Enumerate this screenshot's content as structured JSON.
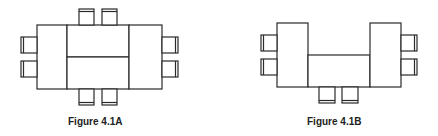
{
  "figures": [
    {
      "id": "fig-4-1a",
      "caption": "Figure 4.1A",
      "description": "Conference table arrangement: rectangular block of tables with 8 chairs",
      "tables": [
        {
          "x": 37,
          "y": 25,
          "w": 30,
          "h": 64
        },
        {
          "x": 67,
          "y": 25,
          "w": 62,
          "h": 32
        },
        {
          "x": 67,
          "y": 57,
          "w": 62,
          "h": 32
        },
        {
          "x": 129,
          "y": 25,
          "w": 33,
          "h": 64
        }
      ],
      "chairs": [
        {
          "x": 79,
          "y": 9,
          "w": 15,
          "h": 16,
          "back": "top"
        },
        {
          "x": 102,
          "y": 9,
          "w": 15,
          "h": 16,
          "back": "top"
        },
        {
          "x": 79,
          "y": 89,
          "w": 15,
          "h": 16,
          "back": "bottom"
        },
        {
          "x": 102,
          "y": 89,
          "w": 15,
          "h": 16,
          "back": "bottom"
        },
        {
          "x": 21,
          "y": 37,
          "w": 16,
          "h": 16,
          "back": "left"
        },
        {
          "x": 21,
          "y": 61,
          "w": 16,
          "h": 16,
          "back": "left"
        },
        {
          "x": 162,
          "y": 37,
          "w": 16,
          "h": 16,
          "back": "right"
        },
        {
          "x": 162,
          "y": 61,
          "w": 16,
          "h": 16,
          "back": "right"
        }
      ]
    },
    {
      "id": "fig-4-1b",
      "caption": "Figure 4.1B",
      "description": "U-shaped table arrangement with 6 chairs",
      "tables": [
        {
          "x": 277,
          "y": 23,
          "w": 31,
          "h": 64
        },
        {
          "x": 308,
          "y": 55,
          "w": 62,
          "h": 32
        },
        {
          "x": 370,
          "y": 23,
          "w": 31,
          "h": 64
        }
      ],
      "chairs": [
        {
          "x": 261,
          "y": 35,
          "w": 16,
          "h": 16,
          "back": "left"
        },
        {
          "x": 261,
          "y": 59,
          "w": 16,
          "h": 16,
          "back": "left"
        },
        {
          "x": 401,
          "y": 35,
          "w": 16,
          "h": 16,
          "back": "right"
        },
        {
          "x": 401,
          "y": 59,
          "w": 16,
          "h": 16,
          "back": "right"
        },
        {
          "x": 319,
          "y": 87,
          "w": 16,
          "h": 16,
          "back": "bottom"
        },
        {
          "x": 342,
          "y": 87,
          "w": 16,
          "h": 16,
          "back": "bottom"
        }
      ]
    }
  ],
  "colors": {
    "stroke": "#2a2a2a",
    "background": "#ffffff",
    "text": "#222222"
  }
}
